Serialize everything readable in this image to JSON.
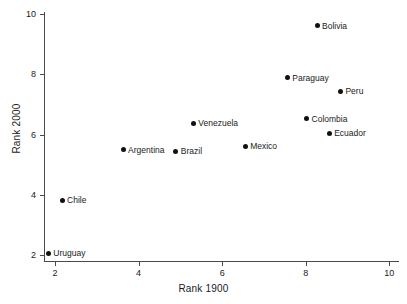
{
  "chart_data": {
    "type": "scatter",
    "title": "",
    "xlabel": "Rank 1900",
    "ylabel": "Rank 2000",
    "xlim": [
      1.3,
      10.3
    ],
    "ylim": [
      1.5,
      10.3
    ],
    "xticks": [
      2,
      4,
      6,
      8,
      10
    ],
    "yticks": [
      2,
      4,
      6,
      8,
      10
    ],
    "xtick_labels": [
      "2",
      "4",
      "6",
      "8",
      "10"
    ],
    "ytick_labels": [
      "2",
      "4",
      "6",
      "8",
      "10"
    ],
    "grid": false,
    "legend": "none",
    "marker": "filled-circle",
    "marker_color": "#111111",
    "points": [
      {
        "label": "Uruguay",
        "x": 1.84,
        "y": 2.06
      },
      {
        "label": "Chile",
        "x": 2.17,
        "y": 3.83
      },
      {
        "label": "Argentina",
        "x": 3.63,
        "y": 5.5
      },
      {
        "label": "Brazil",
        "x": 4.89,
        "y": 5.45
      },
      {
        "label": "Venezuela",
        "x": 5.31,
        "y": 6.38
      },
      {
        "label": "Mexico",
        "x": 6.55,
        "y": 5.61
      },
      {
        "label": "Paraguay",
        "x": 7.56,
        "y": 7.89
      },
      {
        "label": "Colombia",
        "x": 8.02,
        "y": 6.52
      },
      {
        "label": "Bolivia",
        "x": 8.27,
        "y": 9.61
      },
      {
        "label": "Ecuador",
        "x": 8.56,
        "y": 6.05
      },
      {
        "label": "Peru",
        "x": 8.83,
        "y": 7.44
      }
    ]
  }
}
